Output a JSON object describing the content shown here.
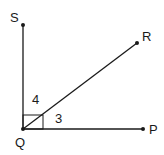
{
  "diagram": {
    "type": "geometry-angles",
    "points": {
      "S": {
        "label": "S"
      },
      "R": {
        "label": "R"
      },
      "Q": {
        "label": "Q"
      },
      "P": {
        "label": "P"
      }
    },
    "angle_labels": {
      "angle4": "4",
      "angle3": "3"
    },
    "rays": [
      "QS",
      "QR",
      "QP"
    ],
    "right_angle_marker": "at Q between QS and QP",
    "line_color": "#1a1a1a"
  }
}
